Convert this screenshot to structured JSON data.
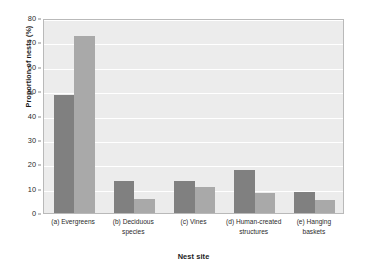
{
  "chart_data": {
    "type": "bar",
    "title": "",
    "subtitle": "",
    "xlabel": "Nest site",
    "ylabel": "Proportion of nests (%)",
    "ylim": [
      0,
      80
    ],
    "ytick_step": 10,
    "yticks": [
      0,
      10,
      20,
      30,
      40,
      50,
      60,
      70,
      80
    ],
    "ytick_labels": [
      "0",
      "10",
      "20",
      "30",
      "40",
      "50",
      "60",
      "70",
      "80"
    ],
    "grid": "horizontal",
    "legend": "none",
    "grouped": true,
    "categories": [
      "(a) Evergreens",
      "(b) Deciduous species",
      "(c) Vines",
      "(d) Human-created structures",
      "(e) Hanging baskets"
    ],
    "category_lines": [
      [
        "(a) Evergreens"
      ],
      [
        "(b) Deciduous",
        "species"
      ],
      [
        "(c) Vines"
      ],
      [
        "(d) Human-created",
        "structures"
      ],
      [
        "(e) Hanging",
        "baskets"
      ]
    ],
    "series": [
      {
        "name": "series-1",
        "color": "#808080",
        "values": [
          48.6,
          13.0,
          13.0,
          17.7,
          8.7
        ]
      },
      {
        "name": "series-2",
        "color": "#a9a9a9",
        "values": [
          72.8,
          5.8,
          10.5,
          8.2,
          5.5
        ]
      }
    ],
    "colors": {
      "plot_background": "#ececec",
      "gridline": "#ffffff",
      "frame": "#b9b9b9",
      "series_1": "#808080",
      "series_2": "#a9a9a9",
      "text": "#2a2a2a"
    }
  }
}
